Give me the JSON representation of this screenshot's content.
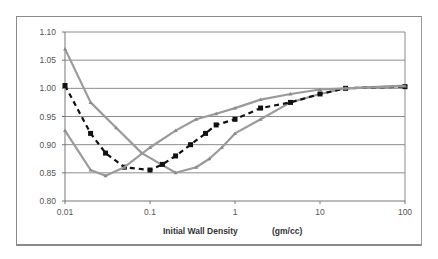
{
  "chart_data": {
    "type": "line",
    "title": "",
    "xlabel": "Initial Wall Density",
    "xlabel_units": "(gm/cc)",
    "ylabel": "",
    "xscale": "log",
    "xlim": [
      0.01,
      100
    ],
    "ylim": [
      0.8,
      1.1
    ],
    "x_ticks": [
      "0.01",
      "0.1",
      "1",
      "10",
      "100"
    ],
    "y_ticks": [
      "0.80",
      "0.85",
      "0.90",
      "0.95",
      "1.00",
      "1.05",
      "1.10"
    ],
    "grid": "horizontal",
    "legend": "none",
    "series": [
      {
        "name": "Series A (gray, high start)",
        "style": "solid gray with small triangle markers",
        "color": "#9a9a9a",
        "x": [
          0.01,
          0.02,
          0.04,
          0.08,
          0.2,
          0.35,
          0.5,
          0.7,
          1,
          2,
          4.5,
          10,
          20,
          100
        ],
        "values": [
          1.07,
          0.975,
          0.93,
          0.885,
          0.85,
          0.86,
          0.875,
          0.895,
          0.92,
          0.945,
          0.975,
          0.99,
          1.0,
          1.005
        ]
      },
      {
        "name": "Series B (black dashed)",
        "style": "black dashed with square markers",
        "color": "#111111",
        "x": [
          0.01,
          0.02,
          0.03,
          0.05,
          0.1,
          0.14,
          0.2,
          0.3,
          0.45,
          0.6,
          1,
          2,
          4.5,
          10,
          20,
          100
        ],
        "values": [
          1.005,
          0.92,
          0.885,
          0.86,
          0.855,
          0.865,
          0.88,
          0.9,
          0.92,
          0.935,
          0.945,
          0.965,
          0.975,
          0.99,
          1.0,
          1.003
        ]
      },
      {
        "name": "Series C (gray, low start)",
        "style": "solid gray with small triangle markers",
        "color": "#9a9a9a",
        "x": [
          0.01,
          0.02,
          0.03,
          0.05,
          0.1,
          0.2,
          0.35,
          0.6,
          1,
          2,
          4.5,
          10,
          20,
          100
        ],
        "values": [
          0.925,
          0.855,
          0.845,
          0.86,
          0.895,
          0.925,
          0.945,
          0.955,
          0.965,
          0.98,
          0.99,
          0.998,
          1.0,
          1.004
        ]
      }
    ]
  },
  "plot_area": {
    "left": 65,
    "right": 405,
    "top": 32,
    "bottom": 201
  }
}
